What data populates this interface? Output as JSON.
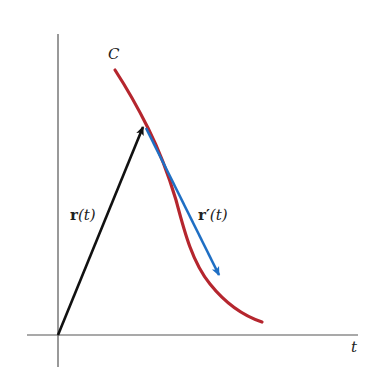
{
  "diagram": {
    "labels": {
      "curve": "C",
      "position_vector_bold": "r",
      "position_vector_arg": "(t)",
      "tangent_vector_bold": "r′",
      "tangent_vector_arg": "(t)",
      "axis_horizontal": "t"
    },
    "colors": {
      "curve": "#b5262e",
      "position_vector": "#111111",
      "tangent_vector": "#1f6fc4",
      "axes": "#555555"
    },
    "geometry": {
      "origin": [
        58,
        335
      ],
      "tangent_point": [
        144,
        124
      ],
      "tangent_arrow_tip": [
        220,
        277
      ],
      "curve_start": [
        115,
        70
      ],
      "curve_end": [
        262,
        322
      ]
    }
  }
}
